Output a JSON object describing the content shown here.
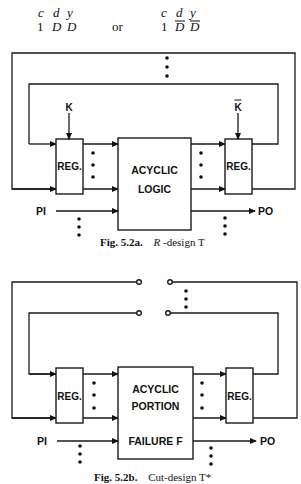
{
  "header": {
    "left": {
      "c": "c",
      "d": "d",
      "y": "y",
      "v1": "1",
      "v2": "D",
      "v3": "D"
    },
    "connector": "or",
    "right": {
      "c": "c",
      "d": "d",
      "y": "y",
      "v1": "1",
      "v2": "D",
      "v3": "D",
      "overbar": true
    }
  },
  "fig_a": {
    "reg_left_label": "REG.",
    "reg_right_label": "REG.",
    "logic_line1": "ACYCLIC",
    "logic_line2": "LOGIC",
    "clock_left": "K",
    "clock_right": "K",
    "clock_right_overbar": true,
    "input_label": "PI",
    "output_label": "PO",
    "caption_prefix": "Fig. 5.2a.",
    "caption_italic": "R",
    "caption_rest": "-design T"
  },
  "fig_b": {
    "reg_left_label": "REG.",
    "reg_right_label": "REG.",
    "logic_line1": "ACYCLIC",
    "logic_line2": "PORTION",
    "logic_line3": "FAILURE F",
    "input_label": "PI",
    "output_label": "PO",
    "caption_prefix": "Fig. 5.2b.",
    "caption_rest": "Cut-design T*"
  },
  "colors": {
    "ink": "#111111",
    "background": "#ffffff"
  }
}
